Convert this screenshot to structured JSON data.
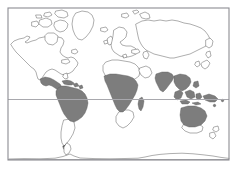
{
  "figure": {
    "type": "world-distribution-map",
    "title": "",
    "caption": "",
    "width": 238,
    "height": 177,
    "background_color": "#ffffff"
  },
  "frame": {
    "name": "map-border",
    "x": 8,
    "y": 8,
    "width": 221,
    "height": 152,
    "stroke_color": "#8c8c93",
    "stroke_width": 1.1,
    "fill": "none"
  },
  "style": {
    "coastline_color": "#4a4a4a",
    "coastline_width": 0.45,
    "land_fill": "#ffffff",
    "highlight_fill": "#7d7d7d",
    "highlight_stroke": "#5a5a5a",
    "graticule_color": "#a8a8ad",
    "graticule_width": 1.0
  },
  "graticule": {
    "lines": [
      {
        "name": "equator-line",
        "label": "Equator",
        "y": 99.5,
        "x1": 8,
        "x2": 229
      },
      {
        "name": "antarctic-reference-line",
        "label": "Southern reference latitude",
        "y": 159.5,
        "x1": 8,
        "x2": 229
      }
    ]
  },
  "legend": {
    "visible": false,
    "entries": [
      {
        "label": "Distribution range",
        "swatch": "#7d7d7d"
      },
      {
        "label": "No occurrence",
        "swatch": "#ffffff"
      }
    ]
  },
  "regions": {
    "unshaded": [
      {
        "name": "north-america",
        "label": "North America"
      },
      {
        "name": "greenland",
        "label": "Greenland"
      },
      {
        "name": "canadian-arctic",
        "label": "Canadian Arctic Archipelago"
      },
      {
        "name": "europe",
        "label": "Europe"
      },
      {
        "name": "british-isles",
        "label": "British Isles"
      },
      {
        "name": "scandinavia",
        "label": "Scandinavia"
      },
      {
        "name": "iceland",
        "label": "Iceland"
      },
      {
        "name": "svalbard",
        "label": "Svalbard"
      },
      {
        "name": "northern-asia",
        "label": "Northern Asia"
      },
      {
        "name": "japan",
        "label": "Japan"
      },
      {
        "name": "north-africa",
        "label": "North Africa"
      },
      {
        "name": "southern-africa",
        "label": "Southern Africa"
      },
      {
        "name": "southern-south-america",
        "label": "Southern South America"
      },
      {
        "name": "antarctica",
        "label": "Antarctica"
      },
      {
        "name": "southern-australia",
        "label": "Southern Australia"
      },
      {
        "name": "new-zealand",
        "label": "New Zealand"
      }
    ],
    "shaded": [
      {
        "name": "central-america-range",
        "label": "Central America"
      },
      {
        "name": "caribbean-range",
        "label": "Caribbean"
      },
      {
        "name": "amazonia-range",
        "label": "Amazon Basin / tropical South America"
      },
      {
        "name": "sub-saharan-africa-range",
        "label": "Sub-Saharan Africa"
      },
      {
        "name": "madagascar-range",
        "label": "Madagascar"
      },
      {
        "name": "south-asia-range",
        "label": "South Asia"
      },
      {
        "name": "southeast-asia-range",
        "label": "Southeast Asia"
      },
      {
        "name": "indonesia-range",
        "label": "Indonesian Archipelago"
      },
      {
        "name": "new-guinea-range",
        "label": "New Guinea"
      },
      {
        "name": "northern-australia-range",
        "label": "Northern Australia"
      }
    ]
  },
  "chart_data": {
    "type": "map",
    "title": "",
    "xlabel": "",
    "ylabel": "",
    "projection": "equirectangular",
    "xlim": [
      -180,
      180
    ],
    "ylim": [
      -90,
      84
    ],
    "grid": false,
    "legend_position": "none",
    "categories": [
      "Central America",
      "Caribbean",
      "Amazon Basin / tropical South America",
      "Sub-Saharan Africa",
      "Madagascar",
      "South Asia",
      "Southeast Asia",
      "Indonesian Archipelago",
      "New Guinea",
      "Northern Australia"
    ],
    "values": [
      1,
      1,
      1,
      1,
      1,
      1,
      1,
      1,
      1,
      1
    ],
    "series": [
      {
        "name": "Distribution range",
        "color": "#7d7d7d",
        "values": [
          1,
          1,
          1,
          1,
          1,
          1,
          1,
          1,
          1,
          1
        ]
      }
    ],
    "annotations": [
      {
        "text": "Equator",
        "y_pixel": 99.5
      },
      {
        "text": "Southern reference latitude",
        "y_pixel": 159.5
      }
    ]
  }
}
